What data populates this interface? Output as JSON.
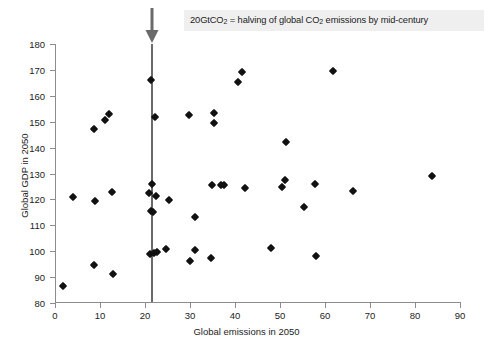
{
  "figure": {
    "background_color": "#ffffff",
    "marker_color": "#111111",
    "threshold_line_color": "#6a6a6a",
    "annotation_bg_color": "#efefef"
  },
  "annotation": {
    "prefix": "20GtCO",
    "sub1": "2",
    "middle": " = halving of global CO",
    "sub2": "2",
    "suffix": " emissions by mid-century",
    "full_text": "20GtCO2 = halving of global CO2 emissions by mid-century",
    "arrow_name": "down-arrow-icon",
    "threshold_value": 20
  },
  "chart_data": {
    "type": "scatter",
    "title": "",
    "xlabel": "Global emissions in 2050",
    "ylabel": "Global GDP in 2050",
    "xlim": [
      0,
      90
    ],
    "ylim": [
      80,
      180
    ],
    "xticks": [
      0,
      10,
      20,
      30,
      40,
      50,
      60,
      70,
      80,
      90
    ],
    "yticks": [
      80,
      90,
      100,
      110,
      120,
      130,
      140,
      150,
      160,
      170,
      180
    ],
    "grid": false,
    "legend": null,
    "annotations": [
      {
        "type": "vline",
        "x": 20,
        "label": "20GtCO2 = halving of global CO2 emissions by mid-century"
      }
    ],
    "series": [
      {
        "name": "Scenarios",
        "marker": "diamond",
        "color": "#111111",
        "points": [
          [
            1.8,
            86.7
          ],
          [
            4.1,
            121.0
          ],
          [
            8.6,
            147.2
          ],
          [
            8.8,
            119.5
          ],
          [
            8.7,
            94.5
          ],
          [
            11.2,
            150.7
          ],
          [
            12.0,
            153.1
          ],
          [
            12.6,
            122.7
          ],
          [
            12.9,
            91.3
          ],
          [
            20.9,
            122.3
          ],
          [
            21.3,
            166.2
          ],
          [
            21.5,
            125.8
          ],
          [
            21.4,
            115.5
          ],
          [
            21.7,
            115.3
          ],
          [
            21.2,
            99.1
          ],
          [
            21.9,
            99.3
          ],
          [
            22.3,
            151.7
          ],
          [
            22.4,
            121.3
          ],
          [
            22.6,
            99.5
          ],
          [
            24.6,
            100.7
          ],
          [
            25.3,
            119.7
          ],
          [
            29.8,
            152.6
          ],
          [
            29.9,
            96.2
          ],
          [
            31.0,
            113.2
          ],
          [
            31.2,
            100.4
          ],
          [
            34.8,
            125.5
          ],
          [
            34.7,
            97.4
          ],
          [
            35.3,
            153.2
          ],
          [
            35.4,
            149.4
          ],
          [
            36.8,
            125.4
          ],
          [
            37.5,
            125.5
          ],
          [
            40.6,
            165.2
          ],
          [
            41.5,
            169.1
          ],
          [
            42.2,
            124.3
          ],
          [
            47.9,
            101.2
          ],
          [
            50.4,
            124.9
          ],
          [
            51.0,
            127.3
          ],
          [
            51.3,
            142.3
          ],
          [
            55.4,
            116.9
          ],
          [
            57.7,
            126.0
          ],
          [
            57.9,
            98.1
          ],
          [
            61.8,
            169.6
          ],
          [
            66.2,
            123.2
          ],
          [
            83.8,
            128.9
          ]
        ]
      }
    ]
  }
}
